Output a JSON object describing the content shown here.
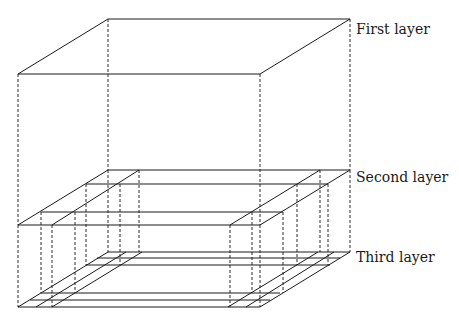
{
  "diagram": {
    "title": "",
    "labels": {
      "first": "First layer",
      "second": "Second layer",
      "third": "Third layer"
    },
    "layers": [
      {
        "name": "First layer",
        "shape": "single parallelogram (top face of box)"
      },
      {
        "name": "Second layer",
        "shape": "two L-shaped bands along left and right sides"
      },
      {
        "name": "Third layer",
        "shape": "grid of three diagonals on each side and three horizontals front and back"
      }
    ],
    "connectors": "dashed vertical projection lines"
  }
}
